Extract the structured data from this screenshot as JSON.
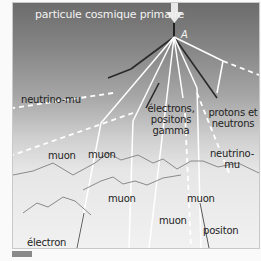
{
  "diagram": {
    "title": "particule cosmique primaire",
    "point_label": "A",
    "labels": {
      "neutrino_mu_left": "neutrino-mu",
      "electrons_positons_gamma": [
        "électrons,",
        "positons",
        "gamma"
      ],
      "protons_neutrons": [
        "protons et",
        "neutrons"
      ],
      "neutrino_mu_right": [
        "neutrino-",
        "mu"
      ],
      "muon_1": "muon",
      "muon_2": "muon",
      "muon_3": "muon",
      "muon_4": "muon",
      "muon_5": "muon",
      "electron": "électron",
      "positon": "positon",
      "neutrino_e_mu": "neutrino-e et mu"
    },
    "colors": {
      "sky_top": "#6c6c6c",
      "sky_bottom": "#f1f1f1",
      "white_track": "#ffffff",
      "dark_track": "#2a2a2a"
    }
  }
}
